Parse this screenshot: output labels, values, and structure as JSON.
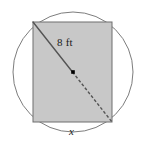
{
  "figure": {
    "canvas": {
      "width": 146,
      "height": 147,
      "background": "#ffffff"
    },
    "circle": {
      "name": "circumscribed-circle",
      "cx": 73,
      "cy": 72,
      "r": 60,
      "stroke": "#7d7d7d",
      "stroke_width": 1,
      "fill": "none"
    },
    "rectangle": {
      "name": "inscribed-rectangle",
      "x": 33,
      "y": 22,
      "width": 79,
      "height": 100,
      "fill": "#c8c8c8",
      "stroke": "#6e6e6e",
      "stroke_width": 1
    },
    "diagonal": {
      "name": "rectangle-diagonal",
      "x1": 33,
      "y1": 22,
      "x2": 112,
      "y2": 122,
      "solid_portion": "top-left-corner-to-center",
      "dashed_portion": "center-to-bottom-right-corner",
      "stroke": "#545454",
      "stroke_width": 1.4,
      "dash_pattern": "3 2"
    },
    "center_point": {
      "name": "circle-center-dot",
      "cx": 73,
      "cy": 72,
      "size": 3.6,
      "fill": "#000000"
    },
    "labels": {
      "diagonal_label": "8 ft",
      "base_label": "x"
    }
  }
}
